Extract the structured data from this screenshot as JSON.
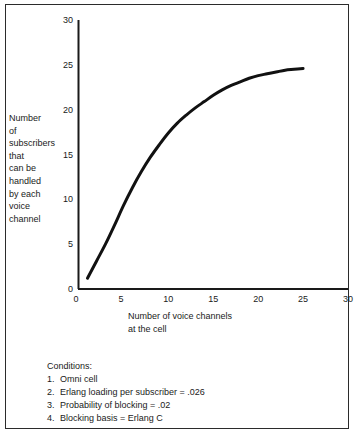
{
  "figure": {
    "background_color": "#ffffff",
    "ink_color": "#1a1a1a",
    "border_color": "#2b2b2b"
  },
  "axes": {
    "y_label_lines": [
      "Number",
      "of",
      "subscribers",
      "that",
      "can be",
      "handled",
      "by each",
      "voice",
      "channel"
    ],
    "x_label_lines": [
      "Number of voice channels",
      "at the cell"
    ],
    "x_tick_labels": [
      "0",
      "5",
      "10",
      "15",
      "20",
      "25",
      "30"
    ],
    "y_tick_labels": [
      "0",
      "5",
      "10",
      "15",
      "20",
      "25",
      "30"
    ]
  },
  "conditions": {
    "title": "Conditions:",
    "items": [
      {
        "num": "1.",
        "text": "Omni cell"
      },
      {
        "num": "2.",
        "text": "Erlang loading per subscriber = .026"
      },
      {
        "num": "3.",
        "text": "Probability of blocking = .02"
      },
      {
        "num": "4.",
        "text": "Blocking basis = Erlang C"
      }
    ]
  },
  "chart_data": {
    "type": "line",
    "title": "",
    "xlabel": "Number of voice channels at the cell",
    "ylabel": "Number of subscribers that can be handled by each voice channel",
    "xlim": [
      0,
      30
    ],
    "ylim": [
      0,
      30
    ],
    "xticks": [
      0,
      5,
      10,
      15,
      20,
      25,
      30
    ],
    "yticks": [
      0,
      5,
      10,
      15,
      20,
      25,
      30
    ],
    "grid": false,
    "legend": false,
    "line_color": "#111111",
    "line_width": 3,
    "series": [
      {
        "name": "Subscribers per voice channel",
        "x": [
          1,
          2,
          3,
          4,
          5,
          6,
          7,
          8,
          9,
          10,
          11,
          12,
          13,
          14,
          15,
          16,
          17,
          18,
          19,
          20,
          21,
          22,
          23,
          24,
          25
        ],
        "y": [
          1.2,
          3.1,
          5.0,
          7.1,
          9.3,
          11.3,
          13.1,
          14.7,
          16.1,
          17.4,
          18.5,
          19.4,
          20.2,
          20.9,
          21.6,
          22.2,
          22.7,
          23.1,
          23.5,
          23.8,
          24.0,
          24.2,
          24.4,
          24.5,
          24.6
        ]
      }
    ]
  }
}
